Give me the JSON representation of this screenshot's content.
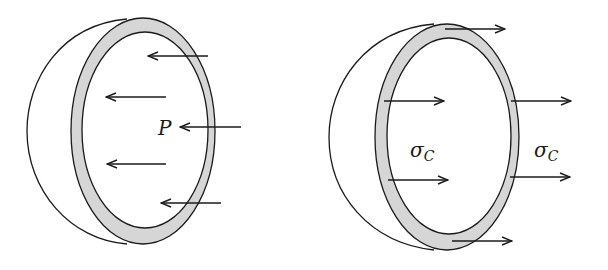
{
  "diagram": {
    "type": "free-body diagram of hemispherical pressure vessel",
    "colors": {
      "line": "#1a1a1a",
      "wall_fill": "#d6d6d6",
      "background": "#ffffff"
    },
    "left_figure": {
      "description": "Hemisphere cut section with internal pressure acting on it",
      "label": "P",
      "arrow_direction": "left",
      "arrow_count": 5
    },
    "right_figure": {
      "description": "Hemisphere cut section with circumferential stress acting on wall",
      "label_symbol": "σ",
      "label_subscript": "C",
      "labels": [
        "σC",
        "σC"
      ],
      "arrow_direction": "right",
      "arrow_count": 6
    }
  }
}
